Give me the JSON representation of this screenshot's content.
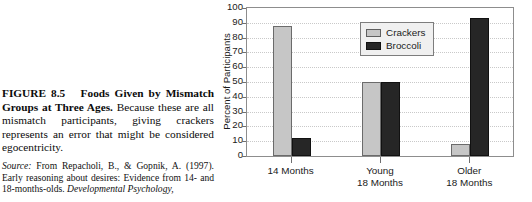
{
  "figure": {
    "label": "FIGURE 8.5",
    "title": "Foods Given by Mismatch Groups at Three Ages.",
    "body": " Because these are all mismatch participants, giving crackers represents an error that might be considered egocentricity.",
    "source_label": "Source:",
    "source_text": " From Repacholi, B., & Gopnik, A. (1997). Early reasoning about desires: Evidence from 14- and 18-months-olds. ",
    "source_journal": "Developmental Psychology,"
  },
  "colors": {
    "crackers": "#c6c6c6",
    "broccoli": "#262626",
    "frame": "#8d8d8d",
    "grid": "#c9c9c9",
    "legend_bg": "#f0f0f0",
    "text": "#1a1a1a"
  },
  "chart_data": {
    "type": "bar",
    "title": "",
    "xlabel": "",
    "ylabel": "Percent of Participants",
    "ylim": [
      0,
      100
    ],
    "ytick_step": 10,
    "yticks": [
      "0",
      "10",
      "20",
      "30",
      "40",
      "50",
      "60",
      "70",
      "80",
      "90",
      "100"
    ],
    "grid": true,
    "legend_position": "top-center",
    "categories": [
      "14 Months",
      "Young 18 Months",
      "Older 18 Months"
    ],
    "category_lines": [
      [
        "14 Months",
        ""
      ],
      [
        "Young",
        "18 Months"
      ],
      [
        "Older",
        "18 Months"
      ]
    ],
    "series": [
      {
        "name": "Crackers",
        "values": [
          88,
          50,
          8
        ]
      },
      {
        "name": "Broccoli",
        "values": [
          12,
          50,
          93
        ]
      }
    ]
  }
}
